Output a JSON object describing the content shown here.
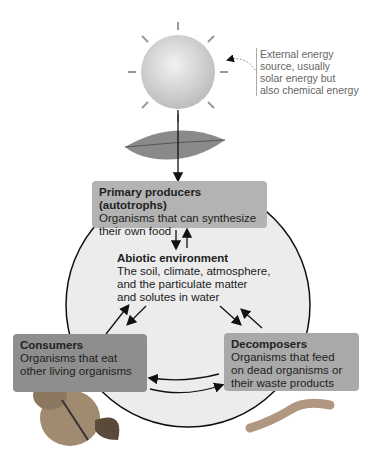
{
  "external_energy": {
    "icon": "sun-icon",
    "note_lines": [
      "External energy",
      "source, usually",
      "solar energy but",
      "also chemical energy"
    ]
  },
  "primary_producers": {
    "title": "Primary producers (autotrophs)",
    "lines": [
      "Organisms that can synthesize",
      "their own food"
    ],
    "color": "#b3b3b3",
    "icon": "leaf-icon"
  },
  "abiotic": {
    "title": "Abiotic environment",
    "lines": [
      "The soil, climate, atmosphere,",
      "and the particulate matter",
      "and solutes in water"
    ],
    "color": "#ececec"
  },
  "consumers": {
    "title": "Consumers",
    "lines": [
      "Organisms that eat",
      "other living organisms"
    ],
    "color": "#8e8e8e",
    "icon": "chipmunk-icon"
  },
  "decomposers": {
    "title": "Decomposers",
    "lines": [
      "Organisms that feed",
      "on dead organisms or",
      "their waste products"
    ],
    "color": "#a9a9a9",
    "icon": "worm-icon"
  }
}
